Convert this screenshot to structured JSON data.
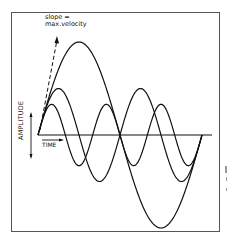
{
  "labels": {
    "slope_line1": "slope =",
    "slope_line2": "max.velocity",
    "time": "TIME",
    "amplitude": "AMPLITUDE"
  },
  "colors": {
    "line": "#111111",
    "frame": "#555555",
    "background": "#ffffff"
  },
  "chart_data": {
    "type": "line",
    "title": "",
    "xlabel": "TIME",
    "ylabel": "AMPLITUDE",
    "annotations": [
      "slope = max.velocity"
    ],
    "series": [
      {
        "name": "wave-1",
        "cycles": 1,
        "relative_amplitude": 1.0
      },
      {
        "name": "wave-2",
        "cycles": 2,
        "relative_amplitude": 0.5
      },
      {
        "name": "wave-3",
        "cycles": 3,
        "relative_amplitude": 0.33
      }
    ],
    "note": "Three sine waves of equal initial slope (max velocity); higher frequency has proportionally lower amplitude",
    "grid": false
  }
}
